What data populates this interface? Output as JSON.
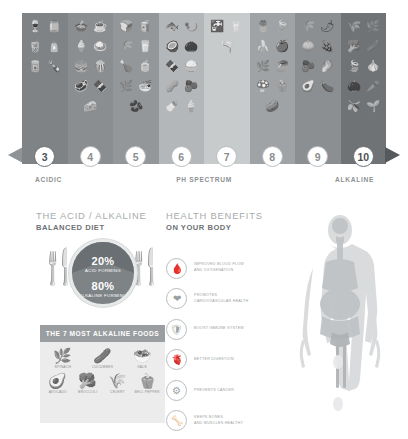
{
  "ph_spectrum": {
    "title": "PH SPECTRUM",
    "left_label": "ACIDIC",
    "right_label": "ALKALINE",
    "columns": [
      {
        "value": "3",
        "color": "#7f8386",
        "foods": [
          "wine-bottle-icon",
          "jar-icon",
          "soda-cup-icon",
          "oil-bottle-icon",
          "canned-food-icon",
          "soda-bottle-icon"
        ]
      },
      {
        "value": "4",
        "color": "#8a8e91",
        "foods": [
          "pot-icon",
          "coffee-cup-icon",
          "ice-cream-icon",
          "roast-dish-icon",
          "burger-icon",
          "popcorn-icon",
          "steak-icon",
          "chocolate-bar-icon",
          "cheese-icon"
        ]
      },
      {
        "value": "5",
        "color": "#949799",
        "foods": [
          "bread-icon",
          "juice-box-icon",
          "wheat-icon",
          "milk-carton-icon",
          "chicken-leg-icon",
          "tea-bag-icon",
          "spinach-icon",
          "noodle-bowl-icon",
          "bean-icon"
        ]
      },
      {
        "value": "6",
        "color": "#b4b7b9",
        "foods": [
          "fish-icon",
          "shrimp-icon",
          "coconut-icon",
          "nuts-icon",
          "chocolate-icon",
          "rice-bowl-icon",
          "peanut-icon",
          "fig-icon",
          "milk-bottle-icon",
          "yogurt-icon"
        ]
      },
      {
        "value": "7",
        "color": "#c8cbcc",
        "foods": [
          "faucet-icon",
          "water-glass-icon",
          "oil-cruet-icon"
        ]
      },
      {
        "value": "8",
        "color": "#9fa3a5",
        "foods": [
          "pineapple-icon",
          "leaf-icon",
          "banana-icon",
          "apple-icon",
          "artichoke-icon",
          "mango-icon",
          "mushroom-icon",
          "bell-pepper-icon",
          "potato-icon"
        ]
      },
      {
        "value": "9",
        "color": "#8b8f92",
        "foods": [
          "asparagus-icon",
          "chili-icon",
          "onion-icon",
          "grapes-icon",
          "beet-icon",
          "lettuce-icon",
          "avocado-icon",
          "eggplant-icon"
        ]
      },
      {
        "value": "10",
        "color": "#6f7376",
        "foods": [
          "chive-icon",
          "spinach-leaf-icon",
          "broccoli-icon",
          "cucumber-icon",
          "basil-icon",
          "garlic-icon",
          "seed-icon",
          "carrot-icon",
          "ginger-icon",
          "sprout-icon"
        ]
      }
    ]
  },
  "diet": {
    "heading_line1": "THE ACID / ALKALINE",
    "heading_line2": "BALANCED DIET",
    "fork_icon": "fork-icon",
    "knife_icon": "knife-icon",
    "pie": {
      "acid_pct": "20%",
      "acid_label": "ACID FORMING",
      "alkaline_pct": "80%",
      "alkaline_label": "ALKALINE FORMING",
      "acid_color": "#6a6f73",
      "alkaline_color": "#7e8386"
    },
    "foods_box": {
      "title": "THE 7 MOST ALKALINE FOODS",
      "rows": [
        [
          {
            "icon": "spinach-icon",
            "glyph": "ἳF",
            "label": "SPINACH"
          },
          {
            "icon": "cucumber-icon",
            "glyph": "ᾕ2",
            "label": "CUCUMBER"
          },
          {
            "icon": "kale-icon",
            "glyph": "ᾕ7",
            "label": "KALE"
          }
        ],
        [
          {
            "icon": "avocado-icon",
            "glyph": "ᾕ1",
            "label": "AVOCADO"
          },
          {
            "icon": "broccoli-icon",
            "glyph": "ᾖ6",
            "label": "BROCCOLI"
          },
          {
            "icon": "celery-icon",
            "glyph": "ἳE",
            "label": "CELERY"
          },
          {
            "icon": "bell-pepper-icon",
            "glyph": "ᾭ1",
            "label": "BELL PEPPER"
          }
        ]
      ]
    }
  },
  "benefits": {
    "heading_line1": "HEALTH BENEFITS",
    "heading_line2": "ON YOUR BODY",
    "items": [
      {
        "icon": "blood-flow-icon",
        "line1": "IMPROVED BLOOD FLOW",
        "line2": "AND OXYGENATION"
      },
      {
        "icon": "heart-icon",
        "line1": "PROMOTES",
        "line2": "CARDIOVASCULAR HEALTH"
      },
      {
        "icon": "shield-icon",
        "line1": "BOOST IMMUNE SYSTEM",
        "line2": ""
      },
      {
        "icon": "stomach-icon",
        "line1": "BETTER DIGESTION",
        "line2": ""
      },
      {
        "icon": "cell-icon",
        "line1": "PREVENTS CANCER",
        "line2": ""
      },
      {
        "icon": "bone-icon",
        "line1": "KEEPS BONES",
        "line2": "AND MUSCLES HEALTHY"
      }
    ]
  },
  "body": {
    "icon": "human-anatomy-icon"
  }
}
